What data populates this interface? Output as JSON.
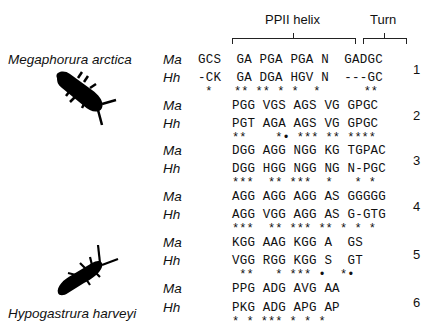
{
  "header": {
    "ppii_label": "PPII helix",
    "turn_label": "Turn"
  },
  "species": {
    "top": "Megaphorura arctica",
    "bottom": "Hypogastrura harveyi"
  },
  "icons": {
    "top_insect": "megaphorura-silhouette-icon",
    "bottom_insect": "hypogastrura-silhouette-icon"
  },
  "blocks": [
    {
      "number": "1",
      "ma_label": "Ma",
      "hh_label": "Hh",
      "ma_seq": "GCS  GA PGA PGA N  GADGC",
      "hh_seq": "-CK  GA DGA HGV N  ---GC",
      "conservation": " *   ** ** * *  *      **"
    },
    {
      "number": "2",
      "ma_label": "Ma",
      "hh_label": "Hh",
      "ma_seq": "PGG VGS AGS VG GPGC",
      "hh_seq": "PGT AGA AGS VG GPGC",
      "conservation": "**    *• *** ** ****"
    },
    {
      "number": "3",
      "ma_label": "Ma",
      "hh_label": "Hh",
      "ma_seq": "DGG AGG NGG KG TGPAC",
      "hh_seq": "DGG HGG NGG NG N-PGC",
      "conservation": "***  ** ***  *   * *"
    },
    {
      "number": "4",
      "ma_label": "Ma",
      "hh_label": "Hh",
      "ma_seq": "AGG AGG AGG AS GGGGG",
      "hh_seq": "AGG VGG AGG AS G-GTG",
      "conservation": "***  ** *** ** * * *"
    },
    {
      "number": "5",
      "ma_label": "Ma",
      "hh_label": "Hh",
      "ma_seq": "KGG AAG KGG A  GS",
      "hh_seq": "VGG RGG KGG S  GT",
      "conservation": " **   * *** •  *•"
    },
    {
      "number": "6",
      "ma_label": "Ma",
      "hh_label": "Hh",
      "ma_seq": "PPG ADG AVG AA",
      "hh_seq": "PKG ADG APG AP",
      "conservation": "* * *** * * *"
    }
  ]
}
